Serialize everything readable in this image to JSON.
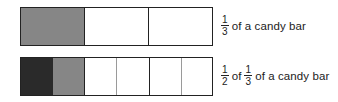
{
  "colors": {
    "border": "#222222",
    "dark_fill": "#2a2a2a",
    "medium_fill": "#868686",
    "empty_fill": "#ffffff",
    "sub_divider": "#9a9a9a"
  },
  "rows": [
    {
      "label": {
        "fraction": {
          "numerator": "1",
          "denominator": "3"
        },
        "text": "of a candy bar"
      },
      "segments": [
        {
          "fill": "medium",
          "width": 64
        },
        {
          "fill": "empty",
          "width": 64
        },
        {
          "fill": "empty",
          "width": 62
        }
      ]
    },
    {
      "label": {
        "fraction1": {
          "numerator": "1",
          "denominator": "2"
        },
        "of": "of",
        "fraction2": {
          "numerator": "1",
          "denominator": "3"
        },
        "text": "of a candy bar"
      },
      "segments": [
        {
          "fill": "dark",
          "width": 32
        },
        {
          "fill": "medium",
          "width": 32
        },
        {
          "fill": "empty",
          "width": 32
        },
        {
          "fill": "empty",
          "width": 32
        },
        {
          "fill": "empty",
          "width": 32
        },
        {
          "fill": "empty",
          "width": 30
        }
      ]
    }
  ]
}
